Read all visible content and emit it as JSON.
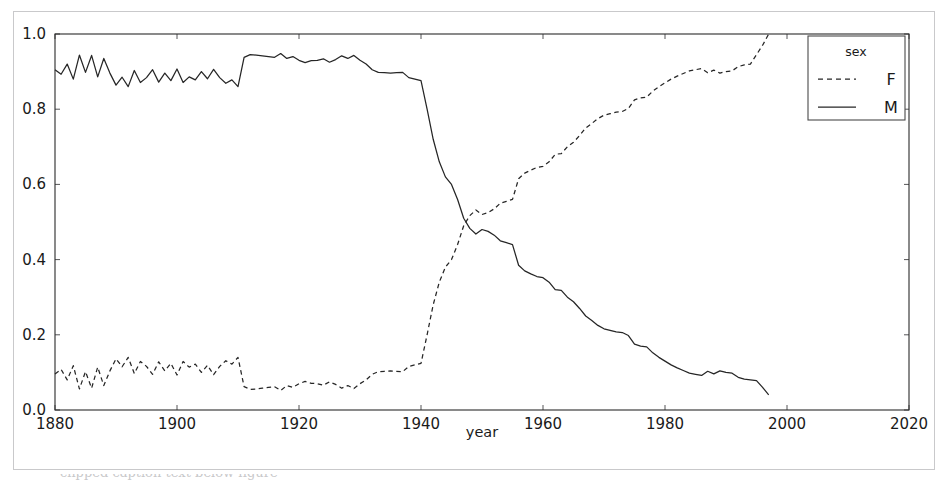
{
  "figure": {
    "background_color": "#ffffff",
    "border_color": "#c9c9cb",
    "line_color": "#262626",
    "caption_partial": "clipped caption text below figure"
  },
  "chart_data": {
    "type": "line",
    "title": "",
    "xlabel": "year",
    "ylabel": "",
    "xlim": [
      1880,
      2020
    ],
    "ylim": [
      0.0,
      1.0
    ],
    "xticks": [
      1880,
      1900,
      1920,
      1940,
      1960,
      1980,
      2000,
      2020
    ],
    "xtick_labels": [
      "1880",
      "1900",
      "1920",
      "1940",
      "1960",
      "1980",
      "2000",
      "2020"
    ],
    "yticks": [
      0.0,
      0.2,
      0.4,
      0.6,
      0.8,
      1.0
    ],
    "ytick_labels": [
      "0.0",
      "0.2",
      "0.4",
      "0.6",
      "0.8",
      "1.0"
    ],
    "grid": false,
    "legend": {
      "title": "sex",
      "position": "upper right",
      "entries": [
        {
          "label": "F",
          "style": "dashed"
        },
        {
          "label": "M",
          "style": "solid"
        }
      ]
    },
    "x": [
      1880,
      1881,
      1882,
      1883,
      1884,
      1885,
      1886,
      1887,
      1888,
      1889,
      1890,
      1891,
      1892,
      1893,
      1894,
      1895,
      1896,
      1897,
      1898,
      1899,
      1900,
      1901,
      1902,
      1903,
      1904,
      1905,
      1906,
      1907,
      1908,
      1909,
      1910,
      1911,
      1912,
      1913,
      1914,
      1915,
      1916,
      1917,
      1918,
      1919,
      1920,
      1921,
      1922,
      1923,
      1924,
      1925,
      1926,
      1927,
      1928,
      1929,
      1930,
      1931,
      1932,
      1933,
      1934,
      1935,
      1936,
      1937,
      1938,
      1939,
      1940,
      1941,
      1942,
      1943,
      1944,
      1945,
      1946,
      1947,
      1948,
      1949,
      1950,
      1951,
      1952,
      1953,
      1954,
      1955,
      1956,
      1957,
      1958,
      1959,
      1960,
      1961,
      1962,
      1963,
      1964,
      1965,
      1966,
      1967,
      1968,
      1969,
      1970,
      1971,
      1972,
      1973,
      1974,
      1975,
      1976,
      1977,
      1978,
      1979,
      1980,
      1981,
      1982,
      1983,
      1984,
      1985,
      1986,
      1987,
      1988,
      1989,
      1990,
      1991,
      1992,
      1993,
      1994,
      1995,
      1996,
      1997
    ],
    "series": [
      {
        "name": "M",
        "style": "solid",
        "values": [
          0.905,
          0.893,
          0.92,
          0.88,
          0.944,
          0.898,
          0.943,
          0.886,
          0.935,
          0.896,
          0.864,
          0.885,
          0.86,
          0.903,
          0.871,
          0.884,
          0.905,
          0.872,
          0.896,
          0.876,
          0.907,
          0.871,
          0.886,
          0.878,
          0.9,
          0.881,
          0.906,
          0.884,
          0.869,
          0.878,
          0.86,
          0.938,
          0.945,
          0.944,
          0.942,
          0.94,
          0.938,
          0.948,
          0.935,
          0.94,
          0.93,
          0.924,
          0.929,
          0.93,
          0.934,
          0.925,
          0.932,
          0.942,
          0.935,
          0.943,
          0.93,
          0.92,
          0.905,
          0.898,
          0.897,
          0.896,
          0.897,
          0.898,
          0.884,
          0.88,
          0.876,
          0.8,
          0.72,
          0.66,
          0.62,
          0.6,
          0.56,
          0.51,
          0.483,
          0.468,
          0.48,
          0.475,
          0.465,
          0.45,
          0.445,
          0.44,
          0.385,
          0.37,
          0.362,
          0.355,
          0.352,
          0.34,
          0.32,
          0.318,
          0.3,
          0.288,
          0.27,
          0.25,
          0.238,
          0.225,
          0.216,
          0.212,
          0.208,
          0.206,
          0.198,
          0.175,
          0.17,
          0.168,
          0.152,
          0.14,
          0.13,
          0.12,
          0.112,
          0.105,
          0.098,
          0.095,
          0.092,
          0.103,
          0.096,
          0.104,
          0.1,
          0.098,
          0.087,
          0.082,
          0.08,
          0.078,
          0.06,
          0.04
        ]
      },
      {
        "name": "F",
        "style": "dashed",
        "values": [
          0.096,
          0.108,
          0.08,
          0.118,
          0.056,
          0.102,
          0.058,
          0.114,
          0.065,
          0.104,
          0.136,
          0.115,
          0.14,
          0.097,
          0.129,
          0.116,
          0.095,
          0.128,
          0.104,
          0.124,
          0.093,
          0.129,
          0.114,
          0.122,
          0.1,
          0.119,
          0.094,
          0.116,
          0.131,
          0.122,
          0.14,
          0.062,
          0.055,
          0.056,
          0.058,
          0.06,
          0.062,
          0.052,
          0.065,
          0.06,
          0.07,
          0.076,
          0.071,
          0.07,
          0.066,
          0.075,
          0.068,
          0.058,
          0.065,
          0.057,
          0.07,
          0.08,
          0.095,
          0.102,
          0.103,
          0.104,
          0.103,
          0.102,
          0.116,
          0.12,
          0.124,
          0.2,
          0.28,
          0.34,
          0.38,
          0.4,
          0.44,
          0.49,
          0.517,
          0.532,
          0.52,
          0.525,
          0.535,
          0.55,
          0.555,
          0.56,
          0.615,
          0.63,
          0.638,
          0.645,
          0.648,
          0.66,
          0.68,
          0.682,
          0.7,
          0.712,
          0.73,
          0.75,
          0.762,
          0.775,
          0.784,
          0.788,
          0.792,
          0.794,
          0.802,
          0.825,
          0.83,
          0.832,
          0.848,
          0.86,
          0.87,
          0.88,
          0.888,
          0.895,
          0.902,
          0.905,
          0.908,
          0.897,
          0.904,
          0.896,
          0.9,
          0.902,
          0.913,
          0.918,
          0.92,
          0.945,
          0.97,
          1.0
        ]
      }
    ]
  }
}
